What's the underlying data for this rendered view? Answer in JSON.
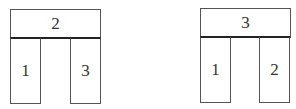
{
  "figures": [
    {
      "name": "left-structure",
      "top_block": {
        "label": "2"
      },
      "left_pillar": {
        "label": "1"
      },
      "right_pillar": {
        "label": "3"
      }
    },
    {
      "name": "right-structure",
      "top_block": {
        "label": "3"
      },
      "left_pillar": {
        "label": "1"
      },
      "right_pillar": {
        "label": "2"
      }
    }
  ],
  "colors": {
    "stroke": "#555555",
    "contact_line": "#222222",
    "background": "#ffffff"
  }
}
